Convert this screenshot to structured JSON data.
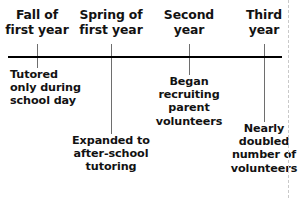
{
  "figure": {
    "type": "timeline",
    "orientation": "horizontal",
    "axis": {
      "color": "#000000",
      "start_x": 8,
      "end_x": 282,
      "y": 57,
      "thickness": 2
    },
    "connector_color": "#6e6e6e",
    "text_color": "#121212"
  },
  "periods": [
    {
      "id": "fall-first-year",
      "line1": "Fall of",
      "line2": "first year",
      "tick_x": 37,
      "center_x": 37
    },
    {
      "id": "spring-first-year",
      "line1": "Spring of",
      "line2": "first year",
      "tick_x": 111,
      "center_x": 111
    },
    {
      "id": "second-year",
      "line1": "Second",
      "line2": "year",
      "tick_x": 189,
      "center_x": 189
    },
    {
      "id": "third-year",
      "line1": "Third",
      "line2": "year",
      "tick_x": 264,
      "center_x": 264
    }
  ],
  "events": [
    {
      "id": "tutored-school-day",
      "lines": [
        "Tutored",
        "only during",
        "school day"
      ],
      "connector_x": 37,
      "connector_top": 58,
      "connector_bottom": 68,
      "text_top": 68,
      "align": "left"
    },
    {
      "id": "expanded-after-school",
      "lines": [
        "Expanded to",
        "after-school",
        "tutoring"
      ],
      "connector_x": 111,
      "connector_top": 58,
      "connector_bottom": 134,
      "text_top": 134,
      "align": "center"
    },
    {
      "id": "recruiting-parent-volunteers",
      "lines": [
        "Began",
        "recruiting",
        "parent",
        "volunteers"
      ],
      "connector_x": 189,
      "connector_top": 58,
      "connector_bottom": 75,
      "text_top": 75,
      "align": "center"
    },
    {
      "id": "doubled-volunteers",
      "lines": [
        "Nearly",
        "doubled",
        "number of",
        "volunteers"
      ],
      "connector_x": 264,
      "connector_top": 58,
      "connector_bottom": 122,
      "text_top": 122,
      "align": "center"
    }
  ],
  "page_edge": {
    "x": 288,
    "color": "#c9c9c9"
  }
}
